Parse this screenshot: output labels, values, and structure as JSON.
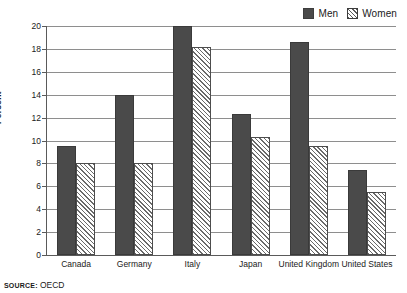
{
  "chart_data": {
    "type": "bar",
    "title": "",
    "subtitle": "",
    "xlabel": "",
    "ylabel": "Percent",
    "ylim": [
      0,
      20
    ],
    "ytick_step": 2,
    "yticks": [
      "20",
      "18",
      "16",
      "14",
      "12",
      "10",
      "8",
      "6",
      "4",
      "2",
      "0"
    ],
    "grid": "horizontal",
    "legend_position": "top-right",
    "categories": [
      "Canada",
      "Germany",
      "Italy",
      "Japan",
      "United Kingdom",
      "United States"
    ],
    "series": [
      {
        "name": "Men",
        "fill": "solid",
        "color": "#4a4a4a",
        "values": [
          9.5,
          14.0,
          20.0,
          12.3,
          18.6,
          7.4
        ]
      },
      {
        "name": "Women",
        "fill": "diagonal-hatch",
        "color": "#ffffff",
        "values": [
          8.0,
          8.0,
          18.2,
          10.3,
          9.5,
          5.5
        ]
      }
    ]
  },
  "legend": {
    "items": [
      {
        "label": "Men",
        "swatch": "solid-square-icon"
      },
      {
        "label": "Women",
        "swatch": "hatched-square-icon"
      }
    ]
  },
  "footer": {
    "source_keyword": "SOURCE:",
    "source_value": "OECD"
  }
}
